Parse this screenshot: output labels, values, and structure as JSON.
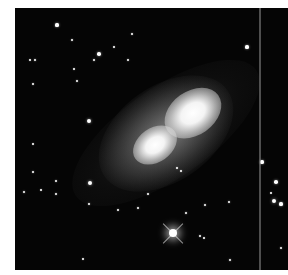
{
  "image": {
    "subject": "bipolar nebula",
    "description": "Grayscale telescope image of a bipolar nebula with two bright lobes oriented diagonally, surrounded by field stars; a bright diffraction-spiked star near the bottom and a vertical detector artifact line near the right edge.",
    "background_color": "#050505",
    "frame": {
      "left": 15,
      "top": 8,
      "width": 273,
      "height": 262
    },
    "nebula": {
      "center": [
        166,
        133
      ],
      "lobes": [
        {
          "x": 193,
          "y": 113,
          "r": 26,
          "label": "upper-right lobe"
        },
        {
          "x": 155,
          "y": 145,
          "r": 20,
          "label": "lower-left lobe"
        }
      ],
      "halo": {
        "width": 150,
        "height": 95,
        "angle_deg": -35
      }
    },
    "artifact_line_x": 244,
    "bright_star": {
      "x": 173,
      "y": 233,
      "spikes": true
    },
    "stars": [
      {
        "x": 42,
        "y": 17,
        "r": 1.6
      },
      {
        "x": 57,
        "y": 32,
        "r": 1.2
      },
      {
        "x": 117,
        "y": 26,
        "r": 1.2
      },
      {
        "x": 84,
        "y": 46,
        "r": 1.8
      },
      {
        "x": 79,
        "y": 52,
        "r": 1.4
      },
      {
        "x": 20,
        "y": 52,
        "r": 1.4
      },
      {
        "x": 62,
        "y": 73,
        "r": 1.2
      },
      {
        "x": 18,
        "y": 76,
        "r": 1.2
      },
      {
        "x": 74,
        "y": 113,
        "r": 2.0
      },
      {
        "x": 59,
        "y": 61,
        "r": 1.0
      },
      {
        "x": 18,
        "y": 136,
        "r": 1.0
      },
      {
        "x": 18,
        "y": 164,
        "r": 1.2
      },
      {
        "x": 41,
        "y": 173,
        "r": 1.2
      },
      {
        "x": 26,
        "y": 182,
        "r": 1.0
      },
      {
        "x": 9,
        "y": 184,
        "r": 1.4
      },
      {
        "x": 41,
        "y": 186,
        "r": 1.2
      },
      {
        "x": 75,
        "y": 175,
        "r": 2.0
      },
      {
        "x": 74,
        "y": 196,
        "r": 1.4
      },
      {
        "x": 123,
        "y": 200,
        "r": 1.4
      },
      {
        "x": 68,
        "y": 251,
        "r": 1.0
      },
      {
        "x": 15,
        "y": 52,
        "r": 1.0
      },
      {
        "x": 99,
        "y": 39,
        "r": 1.0
      },
      {
        "x": 113,
        "y": 52,
        "r": 1.2
      },
      {
        "x": 232,
        "y": 39,
        "r": 1.6
      },
      {
        "x": 162,
        "y": 160,
        "r": 1.0
      },
      {
        "x": 171,
        "y": 205,
        "r": 1.4
      },
      {
        "x": 190,
        "y": 197,
        "r": 1.4
      },
      {
        "x": 214,
        "y": 194,
        "r": 1.4
      },
      {
        "x": 185,
        "y": 228,
        "r": 1.2
      },
      {
        "x": 189,
        "y": 230,
        "r": 1.0
      },
      {
        "x": 215,
        "y": 252,
        "r": 1.4
      },
      {
        "x": 247,
        "y": 154,
        "r": 1.6
      },
      {
        "x": 261,
        "y": 174,
        "r": 1.8
      },
      {
        "x": 256,
        "y": 185,
        "r": 1.0
      },
      {
        "x": 259,
        "y": 193,
        "r": 2.4
      },
      {
        "x": 266,
        "y": 196,
        "r": 1.6
      },
      {
        "x": 266,
        "y": 240,
        "r": 1.2
      },
      {
        "x": 133,
        "y": 186,
        "r": 1.2
      },
      {
        "x": 103,
        "y": 202,
        "r": 1.2
      },
      {
        "x": 166,
        "y": 163,
        "r": 1.0
      }
    ]
  }
}
